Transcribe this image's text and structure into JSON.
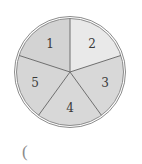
{
  "spinner": {
    "center": [
      70,
      72
    ],
    "outer_radius": 55.5,
    "inner_radius": 53.5,
    "ring_color": "#8c8c8c",
    "divider_color": "#6e6e6e",
    "sectors": [
      {
        "label": "1",
        "fill": "#d3d3d3",
        "start_deg": -162,
        "end_deg": -90,
        "label_pos": [
          50,
          48
        ]
      },
      {
        "label": "2",
        "fill": "#e9e9e9",
        "start_deg": -90,
        "end_deg": -18,
        "label_pos": [
          92,
          48
        ]
      },
      {
        "label": "3",
        "fill": "#d8d8d8",
        "start_deg": -18,
        "end_deg": 54,
        "label_pos": [
          105,
          87
        ]
      },
      {
        "label": "4",
        "fill": "#d8d8d8",
        "start_deg": 54,
        "end_deg": 126,
        "label_pos": [
          70,
          112
        ]
      },
      {
        "label": "5",
        "fill": "#d6d6d6",
        "start_deg": 126,
        "end_deg": 198,
        "label_pos": [
          35,
          87
        ]
      }
    ]
  },
  "answer_blank": {
    "open_paren": "("
  }
}
